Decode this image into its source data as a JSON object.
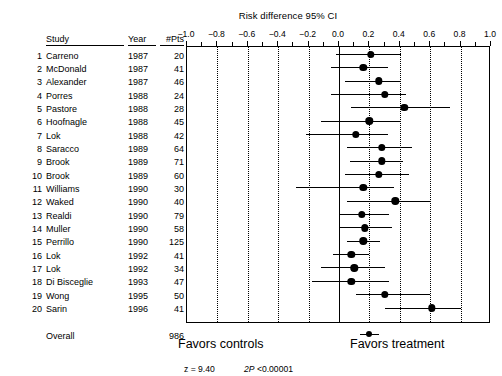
{
  "chart_data": {
    "type": "scatter",
    "title": "Risk difference 95% CI",
    "xlabel": "",
    "ylabel": "",
    "xlim": [
      -1.0,
      1.0
    ],
    "xticks": [
      -1.0,
      -0.8,
      -0.6,
      -0.4,
      -0.2,
      0.0,
      0.2,
      0.4,
      0.6,
      0.8,
      1.0
    ],
    "xtick_labels": [
      "−1.0",
      "−0.8",
      "−0.6",
      "−0.4",
      "−0.2",
      "0.0",
      "0.2",
      "0.4",
      "0.6",
      "0.8",
      "1.0"
    ],
    "gridlines": [
      -0.8,
      -0.6,
      -0.4,
      -0.2,
      0.2,
      0.4,
      0.6,
      0.8
    ],
    "zero_line": 0.0,
    "grid": true,
    "legend": "none",
    "columns": [
      "",
      "Study",
      "Year",
      "#Pts"
    ],
    "rows": [
      {
        "n": "1",
        "study": "Carreno",
        "year": "1987",
        "pts": "20",
        "est": 0.21,
        "lo": -0.02,
        "hi": 0.41
      },
      {
        "n": "2",
        "study": "McDonald",
        "year": "1987",
        "pts": "41",
        "est": 0.16,
        "lo": -0.05,
        "hi": 0.32
      },
      {
        "n": "3",
        "study": "Alexander",
        "year": "1987",
        "pts": "46",
        "est": 0.26,
        "lo": 0.04,
        "hi": 0.41
      },
      {
        "n": "4",
        "study": "Porres",
        "year": "1988",
        "pts": "24",
        "est": 0.3,
        "lo": -0.05,
        "hi": 0.44
      },
      {
        "n": "5",
        "study": "Pastore",
        "year": "1988",
        "pts": "28",
        "est": 0.43,
        "lo": 0.08,
        "hi": 0.73
      },
      {
        "n": "6",
        "study": "Hoofnagle",
        "year": "1988",
        "pts": "45",
        "est": 0.2,
        "lo": -0.12,
        "hi": 0.4
      },
      {
        "n": "7",
        "study": "Lok",
        "year": "1988",
        "pts": "42",
        "est": 0.11,
        "lo": -0.22,
        "hi": 0.32
      },
      {
        "n": "8",
        "study": "Saracco",
        "year": "1989",
        "pts": "64",
        "est": 0.28,
        "lo": 0.05,
        "hi": 0.48
      },
      {
        "n": "9",
        "study": "Brook",
        "year": "1989",
        "pts": "71",
        "est": 0.28,
        "lo": 0.07,
        "hi": 0.42
      },
      {
        "n": "10",
        "study": "Brook",
        "year": "1989",
        "pts": "60",
        "est": 0.26,
        "lo": 0.04,
        "hi": 0.46
      },
      {
        "n": "11",
        "study": "Williams",
        "year": "1990",
        "pts": "30",
        "est": 0.16,
        "lo": -0.28,
        "hi": 0.36
      },
      {
        "n": "12",
        "study": "Waked",
        "year": "1990",
        "pts": "40",
        "est": 0.37,
        "lo": 0.05,
        "hi": 0.6
      },
      {
        "n": "13",
        "study": "Realdi",
        "year": "1990",
        "pts": "79",
        "est": 0.15,
        "lo": 0.0,
        "hi": 0.33
      },
      {
        "n": "14",
        "study": "Muller",
        "year": "1990",
        "pts": "58",
        "est": 0.17,
        "lo": 0.0,
        "hi": 0.35
      },
      {
        "n": "15",
        "study": "Perrillo",
        "year": "1990",
        "pts": "125",
        "est": 0.16,
        "lo": 0.05,
        "hi": 0.27
      },
      {
        "n": "16",
        "study": "Lok",
        "year": "1992",
        "pts": "41",
        "est": 0.08,
        "lo": -0.04,
        "hi": 0.2
      },
      {
        "n": "17",
        "study": "Lok",
        "year": "1992",
        "pts": "34",
        "est": 0.1,
        "lo": -0.12,
        "hi": 0.3
      },
      {
        "n": "18",
        "study": "Di Bisceglie",
        "year": "1993",
        "pts": "47",
        "est": 0.08,
        "lo": -0.18,
        "hi": 0.33
      },
      {
        "n": "19",
        "study": "Wong",
        "year": "1995",
        "pts": "50",
        "est": 0.3,
        "lo": 0.11,
        "hi": 0.6
      },
      {
        "n": "20",
        "study": "Sarin",
        "year": "1996",
        "pts": "41",
        "est": 0.61,
        "lo": 0.3,
        "hi": 0.8
      }
    ],
    "overall": {
      "n": "",
      "study": "Overall",
      "year": "",
      "pts": "986",
      "est": 0.2,
      "lo": 0.14,
      "hi": 0.26,
      "z_label": "z  =",
      "z_value": "9.40",
      "p_label": "2P",
      "p_value": "<0.00001"
    },
    "footer": {
      "left": "Favors controls",
      "right": "Favors treatment"
    }
  }
}
